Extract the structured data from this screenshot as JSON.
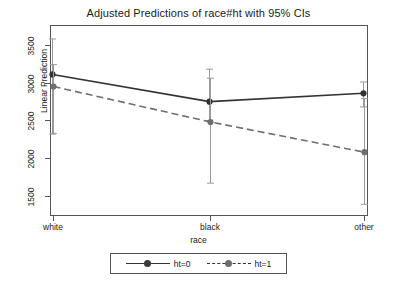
{
  "chart_data": {
    "type": "line",
    "title": "Adjusted Predictions of race#ht with 95% CIs",
    "xlabel": "race",
    "ylabel": "Linear Prediction",
    "categories": [
      "white",
      "black",
      "other"
    ],
    "yticks": [
      1500,
      2000,
      2500,
      3000,
      3500
    ],
    "ylim": [
      1330,
      3610
    ],
    "grid": false,
    "legend_position": "bottom-center",
    "error_bars": "95% CI",
    "series": [
      {
        "name": "ht=0",
        "style": "solid",
        "marker": "filled-circle",
        "color": "#333333",
        "values": [
          3110,
          2750,
          2860
        ],
        "ci_low": [
          2320,
          2500,
          2680
        ],
        "ci_high": [
          3580,
          3180,
          3010
        ]
      },
      {
        "name": "ht=1",
        "style": "dashed",
        "marker": "filled-circle",
        "color": "#6e6e6e",
        "values": [
          2950,
          2480,
          2080
        ],
        "ci_low": [
          2330,
          1670,
          1390
        ],
        "ci_high": [
          3240,
          3060,
          2790
        ]
      }
    ]
  },
  "legend": {
    "entries": [
      {
        "label": "ht=0"
      },
      {
        "label": "ht=1"
      }
    ]
  },
  "ytick_labels": [
    "1500",
    "2000",
    "2500",
    "3000",
    "3500"
  ],
  "xtick_labels": [
    "white",
    "black",
    "other"
  ],
  "colors": {
    "axis": "#555555",
    "series_ht0": "#333333",
    "series_ht1": "#6e6e6e",
    "background": "#ffffff"
  }
}
